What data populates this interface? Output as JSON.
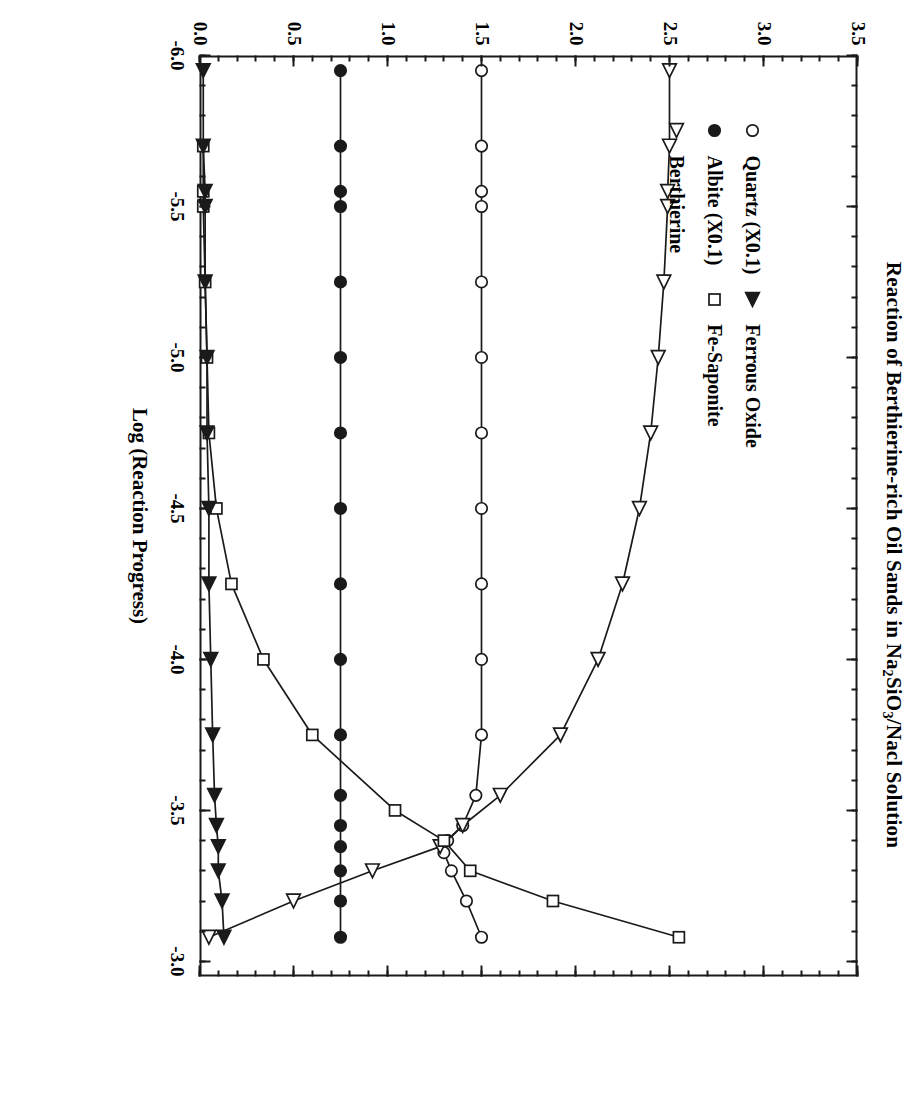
{
  "figure": {
    "title_parts": {
      "before": "Reaction of Berthierine-rich Oil Sands in Na",
      "sub1": "2",
      "mid": "SiO",
      "sub2": "3",
      "after": "/Nacl Solution"
    },
    "title_plain": "Reaction of Berthierine-rich Oil Sands in Na2SiO3/Nacl Solution"
  },
  "legend": {
    "entries": [
      {
        "label": "Quartz (X0.1)",
        "marker": "open-circle-icon"
      },
      {
        "label": "Ferrous Oxide",
        "marker": "filled-triangle-right-icon"
      },
      {
        "label": "Albite (X0.1)",
        "marker": "filled-circle-icon"
      },
      {
        "label": "Fe-Saponite",
        "marker": "open-square-icon"
      },
      {
        "label": "Berthierine",
        "marker": "open-triangle-right-icon"
      }
    ]
  },
  "colors": {
    "ink": "#1a1a1a",
    "background": "#ffffff"
  },
  "chart_data": {
    "type": "line",
    "title": "Reaction of Berthierine-rich Oil Sands in Na2SiO3/Nacl Solution",
    "xlabel": "Log (Reaction Progress)",
    "ylabel": "Grams of Minerals",
    "xlim": [
      -6.0,
      -2.95
    ],
    "ylim": [
      0.0,
      3.5
    ],
    "xticks": [
      -6.0,
      -5.5,
      -5.0,
      -4.5,
      -4.0,
      -3.5,
      -3.0
    ],
    "xtick_labels": [
      "-6.0",
      "-5.5",
      "-5.0",
      "-4.5",
      "-4.0",
      "-3.5",
      "-3.0"
    ],
    "x_minor_step": 0.1,
    "yticks": [
      0.0,
      0.5,
      1.0,
      1.5,
      2.0,
      2.5,
      3.0,
      3.5
    ],
    "ytick_labels": [
      "0.0",
      "0.5",
      "1.0",
      "1.5",
      "2.0",
      "2.5",
      "3.0",
      "3.5"
    ],
    "y_minor_step": 0.1,
    "grid": false,
    "legend_position": "upper-left-inside",
    "series": [
      {
        "name": "Quartz (X0.1)",
        "marker": "open-circle-icon",
        "x": [
          -5.95,
          -5.7,
          -5.55,
          -5.5,
          -5.25,
          -5.0,
          -4.75,
          -4.5,
          -4.25,
          -4.0,
          -3.75,
          -3.55,
          -3.45,
          -3.4,
          -3.36,
          -3.3,
          -3.2,
          -3.08
        ],
        "y": [
          1.5,
          1.5,
          1.5,
          1.5,
          1.5,
          1.5,
          1.5,
          1.5,
          1.5,
          1.5,
          1.5,
          1.47,
          1.4,
          1.32,
          1.3,
          1.34,
          1.42,
          1.5
        ]
      },
      {
        "name": "Albite (X0.1)",
        "marker": "filled-circle-icon",
        "x": [
          -5.95,
          -5.7,
          -5.55,
          -5.5,
          -5.25,
          -5.0,
          -4.75,
          -4.5,
          -4.25,
          -4.0,
          -3.75,
          -3.55,
          -3.45,
          -3.38,
          -3.3,
          -3.2,
          -3.08
        ],
        "y": [
          0.75,
          0.75,
          0.75,
          0.75,
          0.75,
          0.75,
          0.75,
          0.75,
          0.75,
          0.75,
          0.75,
          0.75,
          0.75,
          0.75,
          0.75,
          0.75,
          0.75
        ]
      },
      {
        "name": "Berthierine",
        "marker": "open-triangle-right-icon",
        "x": [
          -5.95,
          -5.7,
          -5.55,
          -5.5,
          -5.25,
          -5.0,
          -4.75,
          -4.5,
          -4.25,
          -4.0,
          -3.75,
          -3.55,
          -3.45,
          -3.38,
          -3.3,
          -3.2,
          -3.08
        ],
        "y": [
          2.5,
          2.5,
          2.49,
          2.49,
          2.47,
          2.44,
          2.4,
          2.34,
          2.25,
          2.12,
          1.92,
          1.6,
          1.4,
          1.28,
          0.92,
          0.5,
          0.05
        ]
      },
      {
        "name": "Fe-Saponite",
        "marker": "open-square-icon",
        "x": [
          -3.08,
          -3.2,
          -3.3,
          -3.4,
          -3.5,
          -3.75,
          -4.0,
          -4.25,
          -4.5,
          -4.75,
          -5.0,
          -5.25,
          -5.5,
          -5.55,
          -5.7
        ],
        "y": [
          2.55,
          1.88,
          1.44,
          1.3,
          1.04,
          0.6,
          0.34,
          0.17,
          0.09,
          0.05,
          0.04,
          0.03,
          0.02,
          0.02,
          0.02
        ]
      },
      {
        "name": "Ferrous Oxide",
        "marker": "filled-triangle-right-icon",
        "x": [
          -5.95,
          -5.7,
          -5.55,
          -5.5,
          -5.25,
          -5.0,
          -4.75,
          -4.5,
          -4.25,
          -4.0,
          -3.75,
          -3.55,
          -3.45,
          -3.38,
          -3.3,
          -3.2,
          -3.08
        ],
        "y": [
          0.02,
          0.02,
          0.03,
          0.03,
          0.03,
          0.04,
          0.04,
          0.05,
          0.05,
          0.06,
          0.07,
          0.08,
          0.09,
          0.1,
          0.1,
          0.12,
          0.13
        ]
      }
    ]
  }
}
